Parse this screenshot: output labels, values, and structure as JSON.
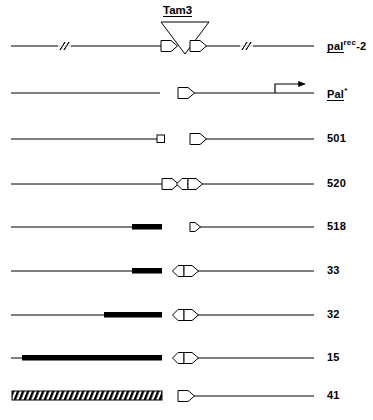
{
  "figure": {
    "title_element": {
      "name": "Tam3",
      "text": "Tam3",
      "underlined": true,
      "x": 163,
      "y": 4
    },
    "background_color": "#ffffff",
    "line_color": "#000000",
    "fill_color": "#000000",
    "row_label_font_size": 11,
    "rows": [
      {
        "id": "row-pal-rec-2",
        "label_parts": {
          "base": "pal",
          "superscript": "rec",
          "suffix": "-2"
        },
        "label_plain": "pal rec -2",
        "label_underline": true,
        "label_italic_base": "pal",
        "y": 46,
        "features": "long line with two discontinuity slashes, two right-pointing pentagons flanking Tam3 insertion triangle"
      },
      {
        "id": "row-pal-star",
        "label_parts": {
          "base": "Pal",
          "superscript": "*",
          "suffix": ""
        },
        "label_plain": "Pal *",
        "label_underline": true,
        "label_italic_base": "Pal",
        "y": 93,
        "features": "left line segment, gap, pentagon, line with upward bent rightward arrow"
      },
      {
        "id": "row-501",
        "label_plain": "501",
        "y": 139,
        "features": "line ending in small open square, gap, pentagon, line"
      },
      {
        "id": "row-520",
        "label_plain": "520",
        "y": 184,
        "features": "line, right pentagon, gap, left pentagon joined to right pentagon, line"
      },
      {
        "id": "row-518",
        "label_plain": "518",
        "y": 227,
        "features": "line with thick black bar, gap, small right pentagon, line"
      },
      {
        "id": "row-33",
        "label_plain": "33",
        "y": 271,
        "features": "line with thick black bar, gap, left pentagon + right pentagon, line"
      },
      {
        "id": "row-32",
        "label_plain": "32",
        "y": 315,
        "features": "line with longer thick black bar, gap, left pentagon + right pentagon, line"
      },
      {
        "id": "row-15",
        "label_plain": "15",
        "y": 358,
        "features": "line almost fully thick black bar, gap, left pentagon + right pentagon, line"
      },
      {
        "id": "row-41",
        "label_plain": "41",
        "y": 396,
        "features": "hatched (diagonally striped) bar, gap, pentagon, line"
      }
    ],
    "label_x": 327
  }
}
